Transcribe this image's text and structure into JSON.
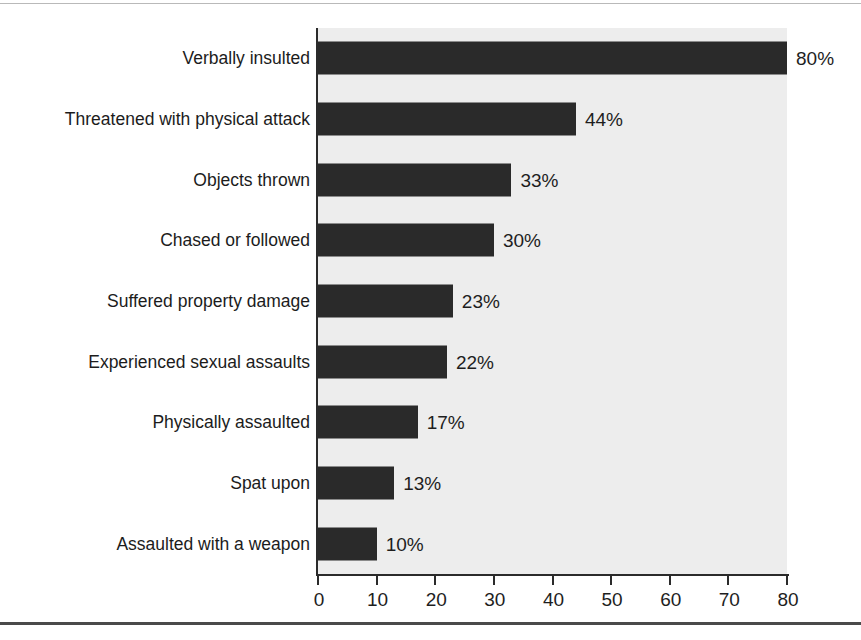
{
  "chart_data": {
    "type": "bar",
    "orientation": "horizontal",
    "title": "",
    "subtitle": "",
    "xlabel": "",
    "ylabel": "",
    "categories": [
      "Verbally insulted",
      "Threatened with physical attack",
      "Objects thrown",
      "Chased or followed",
      "Suffered property damage",
      "Experienced sexual assaults",
      "Physically assaulted",
      "Spat upon",
      "Assaulted with a weapon"
    ],
    "values": [
      80,
      44,
      33,
      30,
      23,
      22,
      17,
      13,
      10
    ],
    "data_labels": [
      "80%",
      "44%",
      "33%",
      "30%",
      "23%",
      "22%",
      "17%",
      "13%",
      "10%"
    ],
    "xlim": [
      0,
      80
    ],
    "xticks": [
      0,
      10,
      20,
      30,
      40,
      50,
      60,
      70,
      80
    ],
    "xtick_labels": [
      "0",
      "10",
      "20",
      "30",
      "40",
      "50",
      "60",
      "70",
      "80"
    ],
    "grid": false,
    "legend": null,
    "legend_position": "none",
    "colors": {
      "bar": "#2a2a2a",
      "plot_background": "#ededed",
      "figure_background": "#ffffff",
      "axis": "#2b2b2b",
      "text": "#1c1c1c"
    }
  }
}
